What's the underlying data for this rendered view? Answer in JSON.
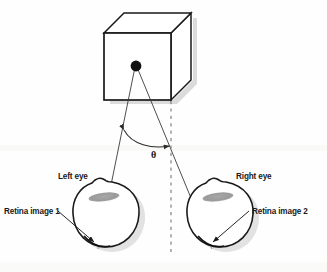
{
  "figure": {
    "title": "",
    "background_color": "#fefefe",
    "stroke_color": "#1a1a1a",
    "shadow_color": "#c9c9c9",
    "lens_color": "#9e9e9e"
  },
  "labels": {
    "left_eye": "Left eye",
    "right_eye": "Right eye",
    "retina_image_1": "Retina image 1",
    "retina_image_2": "Retina image 2",
    "angle": "θ"
  },
  "diagram_data": {
    "type": "diagram",
    "subject": "binocular-disparity-stereopsis",
    "elements": [
      {
        "name": "cube",
        "shape": "isometric-cube",
        "front_face": [
          [
            104,
            33
          ],
          [
            171,
            33
          ],
          [
            171,
            100
          ],
          [
            104,
            100
          ]
        ],
        "top_face": [
          [
            104,
            33
          ],
          [
            124,
            13
          ],
          [
            191,
            13
          ],
          [
            171,
            33
          ]
        ],
        "right_face": [
          [
            171,
            33
          ],
          [
            191,
            13
          ],
          [
            191,
            80
          ],
          [
            171,
            100
          ]
        ],
        "fill": "#ffffff"
      },
      {
        "name": "fixation-point",
        "shape": "filled-circle",
        "center": [
          136,
          66
        ],
        "radius": 5.2,
        "fill": "#111111"
      },
      {
        "name": "sight-line-left",
        "shape": "line",
        "from": [
          136,
          69
        ],
        "to": [
          98,
          250
        ]
      },
      {
        "name": "sight-line-right",
        "shape": "line",
        "from": [
          137,
          69
        ],
        "to": [
          212,
          250
        ]
      },
      {
        "name": "midline",
        "shape": "dashed-vertical-line",
        "from": [
          171,
          100
        ],
        "to": [
          171,
          252
        ],
        "dash": "3 4"
      },
      {
        "name": "convergence-angle-arc",
        "shape": "double-headed-arc",
        "from": [
          123,
          130
        ],
        "to": [
          170,
          146
        ],
        "label": "θ",
        "label_position": [
          153,
          157
        ]
      },
      {
        "name": "left-eyeball",
        "shape": "eye-outline",
        "center": [
          105,
          212
        ],
        "radius": 32,
        "lens": {
          "center": [
            104,
            196
          ],
          "rx": 15,
          "ry": 4.2,
          "rotation": -7
        },
        "retina_hit": [
          98,
          247
        ]
      },
      {
        "name": "right-eyeball",
        "shape": "eye-outline",
        "center": [
          219,
          212
        ],
        "radius": 32,
        "lens": {
          "center": [
            218,
            196
          ],
          "rx": 15,
          "ry": 4.2,
          "rotation": -7
        },
        "retina_hit": [
          212,
          247
        ]
      },
      {
        "name": "retina-1-pointer",
        "shape": "arrow",
        "from": [
          59,
          213
        ],
        "to": [
          95,
          243
        ]
      },
      {
        "name": "retina-2-pointer",
        "shape": "arrow",
        "from": [
          247,
          213
        ],
        "to": [
          211,
          243
        ]
      }
    ],
    "label_positions": {
      "left_eye": [
        60,
        176
      ],
      "right_eye": [
        239,
        176
      ],
      "retina_image_1": [
        5,
        211
      ],
      "retina_image_2": [
        253,
        211
      ],
      "angle": [
        153,
        157
      ]
    }
  }
}
